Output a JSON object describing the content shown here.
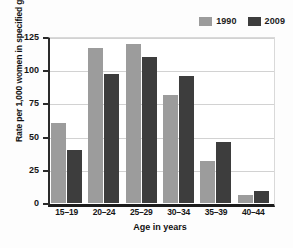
{
  "chart_data": {
    "type": "bar",
    "title": "",
    "xlabel": "Age in years",
    "ylabel": "Rate per 1,000 women in specified group",
    "categories": [
      "15–19",
      "20–24",
      "25–29",
      "30–34",
      "35–39",
      "40–44"
    ],
    "series": [
      {
        "name": "1990",
        "color": "#9c9c9c",
        "values": [
          60,
          117,
          120,
          81,
          32,
          6
        ]
      },
      {
        "name": "2009",
        "color": "#3d3d3d",
        "values": [
          40,
          97,
          110,
          96,
          46,
          9
        ]
      }
    ],
    "ylim": [
      0,
      125
    ],
    "yticks": [
      "0",
      "25",
      "50",
      "75",
      "100",
      "125"
    ],
    "ytick_values": [
      0,
      25,
      50,
      75,
      100,
      125
    ],
    "grid": true,
    "legend_position": "top-right"
  }
}
